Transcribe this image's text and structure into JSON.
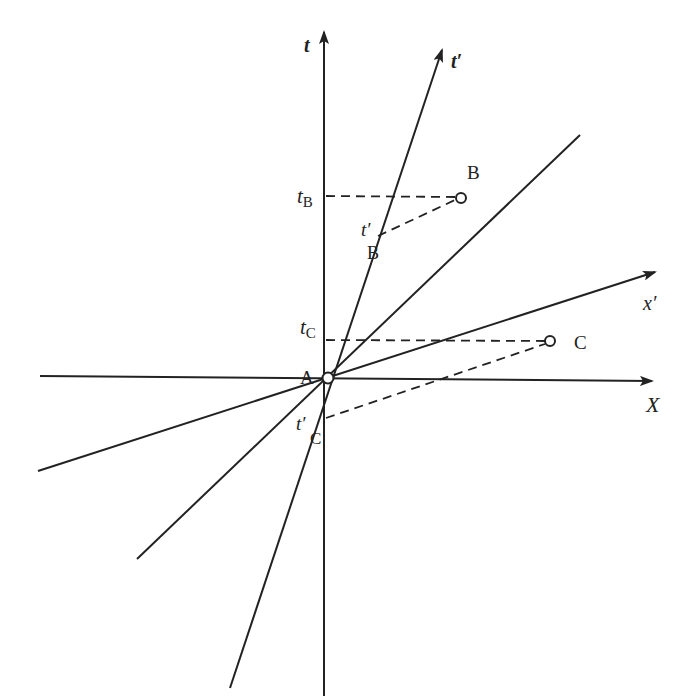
{
  "diagram": {
    "colors": {
      "ink": "#222222",
      "background": "#ffffff"
    },
    "origin": {
      "label": "A",
      "x": 328,
      "y": 378
    },
    "axes": {
      "t": {
        "label": "t",
        "x1": 324,
        "y1": 696,
        "x2": 324,
        "y2": 30
      },
      "X": {
        "label": "X",
        "x1": 40,
        "y1": 376,
        "x2": 656,
        "y2": 381
      },
      "t_prime": {
        "label": "t′",
        "x1": 230,
        "y1": 688,
        "x2": 443,
        "y2": 45
      },
      "x_prime": {
        "label": "x′",
        "x1": 38,
        "y1": 471,
        "x2": 659,
        "y2": 271
      },
      "light_line": {
        "x1": 137,
        "y1": 559,
        "x2": 580,
        "y2": 135
      }
    },
    "events": [
      {
        "name": "B",
        "label": "B",
        "x": 460,
        "y": 198,
        "t_label": "t",
        "t_sub": "B",
        "t_y": 196,
        "tprime_label": "t′",
        "tprime_sub": "B",
        "tprime_x": 378,
        "tprime_y": 236
      },
      {
        "name": "C",
        "label": "C",
        "x": 550,
        "y": 341,
        "t_label": "t",
        "t_sub": "C",
        "t_y": 340,
        "tprime_label": "t′",
        "tprime_sub": "C",
        "tprime_x": 325,
        "tprime_y": 418
      }
    ]
  }
}
